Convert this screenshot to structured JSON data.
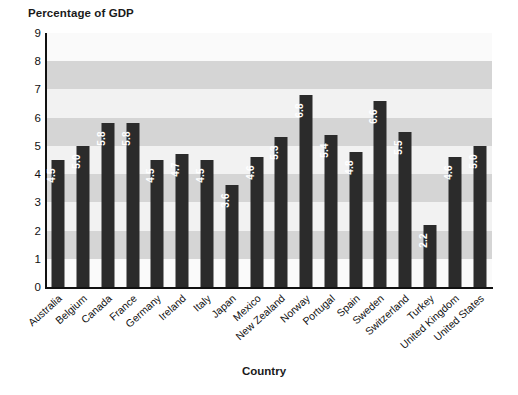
{
  "chart_data": {
    "type": "bar",
    "title": "Percentage of GDP",
    "xlabel": "Country",
    "ylabel": "",
    "ylim": [
      0,
      9
    ],
    "ytick_step": 1,
    "yticks": [
      "9",
      "8",
      "7",
      "6",
      "5",
      "4",
      "3",
      "2",
      "1",
      "0"
    ],
    "grid": "horizontal-alternating-bands",
    "legend": "none",
    "bar_color": "#2b2b2b",
    "value_label_color": "#ffffff",
    "categories": [
      "Australia",
      "Belgium",
      "Canada",
      "France",
      "Germany",
      "Ireland",
      "Italy",
      "Japan",
      "Mexico",
      "New Zealand",
      "Norway",
      "Portugal",
      "Spain",
      "Sweden",
      "Switzerland",
      "Turkey",
      "United Kingdom",
      "United States"
    ],
    "values": [
      4.5,
      5.0,
      5.8,
      5.8,
      4.5,
      4.7,
      4.5,
      3.6,
      4.6,
      5.3,
      6.8,
      5.4,
      4.8,
      6.6,
      5.5,
      2.2,
      4.6,
      5.0
    ],
    "value_labels": [
      "4.5",
      "5.0",
      "5.8",
      "5.8",
      "4.5",
      "4.7",
      "4.5",
      "3.6",
      "4.6",
      "5.3",
      "6.8",
      "5.4",
      "4.8",
      "6.6",
      "5.5",
      "2.2",
      "4.6",
      "5.0"
    ]
  },
  "colors": {
    "background": "#ffffff",
    "band_dark": "#d5d5d5",
    "band_light": "#f2f2f2",
    "axis": "#111111",
    "bar": "#2b2b2b"
  }
}
